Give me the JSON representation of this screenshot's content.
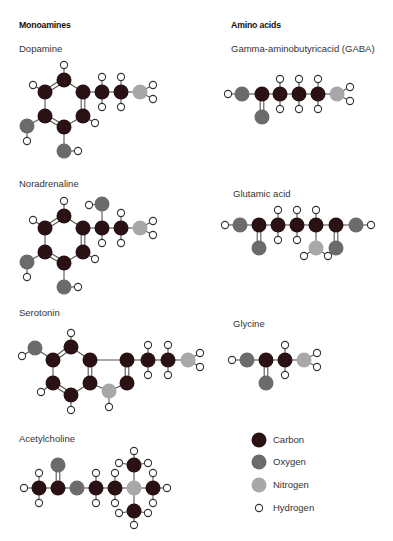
{
  "headers": {
    "left": "Monoamines",
    "right": "Amino acids"
  },
  "colors": {
    "carbon": "#2a1214",
    "oxygen": "#6b6b6b",
    "nitrogen": "#a8a8a8",
    "hydrogen": "#ffffff",
    "bond": "#555555",
    "outline": "#333333"
  },
  "molecules": [
    {
      "name": "Dopamine",
      "label_pos": [
        19,
        43
      ],
      "atoms": [
        [
          "C",
          64,
          80
        ],
        [
          "C",
          45,
          92
        ],
        [
          "C",
          83,
          92
        ],
        [
          "C",
          45,
          116
        ],
        [
          "C",
          83,
          116
        ],
        [
          "C",
          64,
          127
        ],
        [
          "C",
          102,
          92
        ],
        [
          "C",
          121,
          92
        ],
        [
          "N",
          140,
          92
        ],
        [
          "O",
          27,
          126
        ],
        [
          "O",
          64,
          151
        ],
        [
          "H",
          64,
          65
        ],
        [
          "H",
          33,
          85
        ],
        [
          "H",
          95,
          123
        ],
        [
          "H",
          102,
          77
        ],
        [
          "H",
          102,
          107
        ],
        [
          "H",
          121,
          77
        ],
        [
          "H",
          121,
          107
        ],
        [
          "H",
          153,
          85
        ],
        [
          "H",
          153,
          99
        ],
        [
          "H",
          27,
          141
        ],
        [
          "H",
          78,
          151
        ]
      ],
      "bonds": [
        [
          0,
          1,
          2
        ],
        [
          0,
          2,
          1
        ],
        [
          1,
          3,
          1
        ],
        [
          2,
          4,
          2
        ],
        [
          3,
          5,
          2
        ],
        [
          4,
          5,
          1
        ],
        [
          2,
          6,
          1
        ],
        [
          6,
          7,
          1
        ],
        [
          7,
          8,
          1
        ],
        [
          3,
          9,
          1
        ],
        [
          5,
          10,
          1
        ],
        [
          0,
          11,
          1
        ],
        [
          1,
          12,
          1
        ],
        [
          4,
          13,
          1
        ],
        [
          6,
          14,
          1
        ],
        [
          6,
          15,
          1
        ],
        [
          7,
          16,
          1
        ],
        [
          7,
          17,
          1
        ],
        [
          8,
          18,
          1
        ],
        [
          8,
          19,
          1
        ],
        [
          9,
          20,
          1
        ],
        [
          10,
          21,
          1
        ]
      ]
    },
    {
      "name": "Noradrenaline",
      "label_pos": [
        19,
        178
      ],
      "atoms": [
        [
          "C",
          64,
          216
        ],
        [
          "C",
          45,
          228
        ],
        [
          "C",
          83,
          228
        ],
        [
          "C",
          45,
          252
        ],
        [
          "C",
          83,
          252
        ],
        [
          "C",
          64,
          263
        ],
        [
          "C",
          102,
          228
        ],
        [
          "C",
          121,
          228
        ],
        [
          "N",
          140,
          228
        ],
        [
          "O",
          27,
          262
        ],
        [
          "O",
          64,
          287
        ],
        [
          "O",
          102,
          204
        ],
        [
          "H",
          64,
          201
        ],
        [
          "H",
          33,
          220
        ],
        [
          "H",
          95,
          259
        ],
        [
          "H",
          89,
          205
        ],
        [
          "H",
          102,
          243
        ],
        [
          "H",
          121,
          213
        ],
        [
          "H",
          121,
          243
        ],
        [
          "H",
          153,
          221
        ],
        [
          "H",
          153,
          235
        ],
        [
          "H",
          27,
          277
        ],
        [
          "H",
          78,
          287
        ]
      ],
      "bonds": [
        [
          0,
          1,
          2
        ],
        [
          0,
          2,
          1
        ],
        [
          1,
          3,
          1
        ],
        [
          2,
          4,
          2
        ],
        [
          3,
          5,
          2
        ],
        [
          4,
          5,
          1
        ],
        [
          2,
          6,
          1
        ],
        [
          6,
          7,
          1
        ],
        [
          7,
          8,
          1
        ],
        [
          3,
          9,
          1
        ],
        [
          5,
          10,
          1
        ],
        [
          6,
          11,
          1
        ],
        [
          0,
          12,
          1
        ],
        [
          1,
          13,
          1
        ],
        [
          4,
          14,
          1
        ],
        [
          11,
          15,
          1
        ],
        [
          6,
          16,
          1
        ],
        [
          7,
          17,
          1
        ],
        [
          7,
          18,
          1
        ],
        [
          8,
          19,
          1
        ],
        [
          8,
          20,
          1
        ],
        [
          9,
          21,
          1
        ],
        [
          10,
          22,
          1
        ]
      ]
    },
    {
      "name": "Serotonin",
      "label_pos": [
        19,
        307
      ],
      "atoms": [
        [
          "O",
          35,
          348
        ],
        [
          "C",
          53,
          360
        ],
        [
          "C",
          71,
          347
        ],
        [
          "C",
          90,
          360
        ],
        [
          "C",
          90,
          383
        ],
        [
          "C",
          71,
          395
        ],
        [
          "C",
          53,
          383
        ],
        [
          "C",
          127,
          360
        ],
        [
          "C",
          127,
          383
        ],
        [
          "N",
          109,
          391
        ],
        [
          "C",
          148,
          360
        ],
        [
          "C",
          168,
          360
        ],
        [
          "N",
          188,
          360
        ],
        [
          "H",
          22,
          356
        ],
        [
          "H",
          71,
          333
        ],
        [
          "H",
          41,
          392
        ],
        [
          "H",
          71,
          410
        ],
        [
          "H",
          109,
          407
        ],
        [
          "H",
          148,
          345
        ],
        [
          "H",
          148,
          375
        ],
        [
          "H",
          168,
          345
        ],
        [
          "H",
          168,
          375
        ],
        [
          "H",
          200,
          353
        ],
        [
          "H",
          200,
          367
        ]
      ],
      "bonds": [
        [
          0,
          1,
          1
        ],
        [
          1,
          2,
          2
        ],
        [
          2,
          3,
          1
        ],
        [
          3,
          4,
          2
        ],
        [
          4,
          5,
          1
        ],
        [
          5,
          6,
          2
        ],
        [
          6,
          1,
          1
        ],
        [
          3,
          7,
          1
        ],
        [
          7,
          8,
          2
        ],
        [
          8,
          9,
          1
        ],
        [
          9,
          4,
          1
        ],
        [
          7,
          10,
          1
        ],
        [
          10,
          11,
          1
        ],
        [
          11,
          12,
          1
        ],
        [
          0,
          13,
          1
        ],
        [
          2,
          14,
          1
        ],
        [
          6,
          15,
          1
        ],
        [
          5,
          16,
          1
        ],
        [
          9,
          17,
          1
        ],
        [
          10,
          18,
          1
        ],
        [
          10,
          19,
          1
        ],
        [
          11,
          20,
          1
        ],
        [
          11,
          21,
          1
        ],
        [
          12,
          22,
          1
        ],
        [
          12,
          23,
          1
        ]
      ]
    },
    {
      "name": "Acetylcholine",
      "label_pos": [
        19,
        433
      ],
      "atoms": [
        [
          "C",
          39,
          488
        ],
        [
          "C",
          58,
          488
        ],
        [
          "O",
          58,
          465
        ],
        [
          "O",
          77,
          488
        ],
        [
          "C",
          96,
          488
        ],
        [
          "C",
          115,
          488
        ],
        [
          "N",
          134,
          488
        ],
        [
          "C",
          134,
          465
        ],
        [
          "C",
          134,
          511
        ],
        [
          "C",
          153,
          488
        ],
        [
          "H",
          24,
          488
        ],
        [
          "H",
          39,
          473
        ],
        [
          "H",
          39,
          503
        ],
        [
          "H",
          96,
          473
        ],
        [
          "H",
          96,
          503
        ],
        [
          "H",
          115,
          473
        ],
        [
          "H",
          115,
          503
        ],
        [
          "H",
          134,
          451
        ],
        [
          "H",
          119,
          463
        ],
        [
          "H",
          148,
          463
        ],
        [
          "H",
          134,
          525
        ],
        [
          "H",
          119,
          513
        ],
        [
          "H",
          148,
          513
        ],
        [
          "H",
          167,
          488
        ],
        [
          "H",
          153,
          473
        ],
        [
          "H",
          153,
          503
        ]
      ],
      "bonds": [
        [
          0,
          1,
          1
        ],
        [
          1,
          2,
          2
        ],
        [
          1,
          3,
          1
        ],
        [
          3,
          4,
          1
        ],
        [
          4,
          5,
          1
        ],
        [
          5,
          6,
          1
        ],
        [
          6,
          7,
          1
        ],
        [
          6,
          8,
          1
        ],
        [
          6,
          9,
          1
        ],
        [
          0,
          10,
          1
        ],
        [
          0,
          11,
          1
        ],
        [
          0,
          12,
          1
        ],
        [
          4,
          13,
          1
        ],
        [
          4,
          14,
          1
        ],
        [
          5,
          15,
          1
        ],
        [
          5,
          16,
          1
        ],
        [
          7,
          17,
          1
        ],
        [
          7,
          18,
          1
        ],
        [
          7,
          19,
          1
        ],
        [
          8,
          20,
          1
        ],
        [
          8,
          21,
          1
        ],
        [
          8,
          22,
          1
        ],
        [
          9,
          23,
          1
        ],
        [
          9,
          24,
          1
        ],
        [
          9,
          25,
          1
        ]
      ]
    },
    {
      "name": "Gamma-aminobutyricacid (GABA)",
      "label_pos": [
        231,
        43
      ],
      "atoms": [
        [
          "H",
          228,
          94
        ],
        [
          "O",
          242,
          94
        ],
        [
          "C",
          262,
          94
        ],
        [
          "O",
          262,
          117
        ],
        [
          "C",
          280,
          94
        ],
        [
          "C",
          299,
          94
        ],
        [
          "C",
          318,
          94
        ],
        [
          "N",
          337,
          94
        ],
        [
          "H",
          280,
          79
        ],
        [
          "H",
          280,
          109
        ],
        [
          "H",
          299,
          79
        ],
        [
          "H",
          299,
          109
        ],
        [
          "H",
          318,
          79
        ],
        [
          "H",
          318,
          109
        ],
        [
          "H",
          350,
          87
        ],
        [
          "H",
          350,
          101
        ]
      ],
      "bonds": [
        [
          0,
          1,
          1
        ],
        [
          1,
          2,
          1
        ],
        [
          2,
          3,
          2
        ],
        [
          2,
          4,
          1
        ],
        [
          4,
          5,
          1
        ],
        [
          5,
          6,
          1
        ],
        [
          6,
          7,
          1
        ],
        [
          4,
          8,
          1
        ],
        [
          4,
          9,
          1
        ],
        [
          5,
          10,
          1
        ],
        [
          5,
          11,
          1
        ],
        [
          6,
          12,
          1
        ],
        [
          6,
          13,
          1
        ],
        [
          7,
          14,
          1
        ],
        [
          7,
          15,
          1
        ]
      ]
    },
    {
      "name": "Glutamic acid",
      "label_pos": [
        233,
        188
      ],
      "atoms": [
        [
          "H",
          225,
          225
        ],
        [
          "O",
          240,
          225
        ],
        [
          "C",
          259,
          225
        ],
        [
          "O",
          259,
          248
        ],
        [
          "C",
          278,
          225
        ],
        [
          "C",
          297,
          225
        ],
        [
          "C",
          316,
          225
        ],
        [
          "N",
          316,
          248
        ],
        [
          "C",
          336,
          225
        ],
        [
          "O",
          336,
          248
        ],
        [
          "O",
          356,
          225
        ],
        [
          "H",
          371,
          225
        ],
        [
          "H",
          278,
          210
        ],
        [
          "H",
          278,
          240
        ],
        [
          "H",
          297,
          210
        ],
        [
          "H",
          297,
          240
        ],
        [
          "H",
          316,
          210
        ],
        [
          "H",
          304,
          256
        ],
        [
          "H",
          328,
          256
        ]
      ],
      "bonds": [
        [
          0,
          1,
          1
        ],
        [
          1,
          2,
          1
        ],
        [
          2,
          3,
          2
        ],
        [
          2,
          4,
          1
        ],
        [
          4,
          5,
          1
        ],
        [
          5,
          6,
          1
        ],
        [
          6,
          7,
          1
        ],
        [
          6,
          8,
          1
        ],
        [
          8,
          9,
          2
        ],
        [
          8,
          10,
          1
        ],
        [
          10,
          11,
          1
        ],
        [
          4,
          12,
          1
        ],
        [
          4,
          13,
          1
        ],
        [
          5,
          14,
          1
        ],
        [
          5,
          15,
          1
        ],
        [
          6,
          16,
          1
        ],
        [
          7,
          17,
          1
        ],
        [
          7,
          18,
          1
        ]
      ]
    },
    {
      "name": "Glycine",
      "label_pos": [
        233,
        318
      ],
      "atoms": [
        [
          "H",
          232,
          360
        ],
        [
          "O",
          247,
          360
        ],
        [
          "C",
          266,
          360
        ],
        [
          "O",
          266,
          383
        ],
        [
          "C",
          285,
          360
        ],
        [
          "N",
          304,
          360
        ],
        [
          "H",
          285,
          345
        ],
        [
          "H",
          285,
          375
        ],
        [
          "H",
          317,
          353
        ],
        [
          "H",
          317,
          367
        ]
      ],
      "bonds": [
        [
          0,
          1,
          1
        ],
        [
          1,
          2,
          1
        ],
        [
          2,
          3,
          2
        ],
        [
          2,
          4,
          1
        ],
        [
          4,
          5,
          1
        ],
        [
          4,
          6,
          1
        ],
        [
          4,
          7,
          1
        ],
        [
          5,
          8,
          1
        ],
        [
          5,
          9,
          1
        ]
      ]
    }
  ],
  "legend": [
    {
      "element": "C",
      "label": "Carbon",
      "y": 440
    },
    {
      "element": "O",
      "label": "Oxygen",
      "y": 462
    },
    {
      "element": "N",
      "label": "Nitrogen",
      "y": 485
    },
    {
      "element": "H",
      "label": "Hydrogen",
      "y": 508
    }
  ]
}
